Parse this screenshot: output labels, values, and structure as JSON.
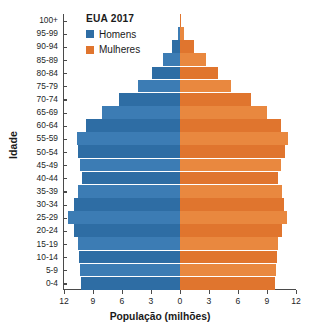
{
  "chart_data": {
    "type": "bar",
    "subtype": "population-pyramid",
    "title": "EUA 2017",
    "xlabel": "População (milhões)",
    "ylabel": "Idade",
    "grid": false,
    "legend_position": "top-left",
    "xlim": [
      -12,
      12
    ],
    "xticks": [
      "12",
      "9",
      "6",
      "3",
      "0",
      "3",
      "6",
      "9",
      "12"
    ],
    "xtick_values": [
      -12,
      -9,
      -6,
      -3,
      0,
      3,
      6,
      9,
      12
    ],
    "categories": [
      "0-4",
      "5-9",
      "10-14",
      "15-19",
      "20-24",
      "25-29",
      "30-34",
      "35-39",
      "40-44",
      "45-49",
      "50-54",
      "55-59",
      "60-64",
      "65-69",
      "70-74",
      "75-79",
      "80-84",
      "85-89",
      "90-94",
      "95-99",
      "100+"
    ],
    "series": [
      {
        "name": "Homens",
        "color": "#2E6DA4",
        "values": [
          10.2,
          10.3,
          10.4,
          10.6,
          11.0,
          11.6,
          11.0,
          10.6,
          10.1,
          10.3,
          10.6,
          10.7,
          9.7,
          8.1,
          6.3,
          4.3,
          2.9,
          1.8,
          0.8,
          0.2,
          0.04
        ]
      },
      {
        "name": "Mulheres",
        "color": "#E0752E",
        "values": [
          9.8,
          9.9,
          10.0,
          10.1,
          10.5,
          11.1,
          10.8,
          10.5,
          10.1,
          10.4,
          10.9,
          11.2,
          10.4,
          9.0,
          7.3,
          5.3,
          3.9,
          2.7,
          1.4,
          0.4,
          0.08
        ]
      }
    ]
  },
  "legend": {
    "items": [
      {
        "label": "Homens",
        "color": "#2E6DA4"
      },
      {
        "label": "Mulheres",
        "color": "#E0752E"
      }
    ]
  },
  "colors": {
    "male": "#2E6DA4",
    "male_alt": "#3C7CB4",
    "female": "#E0752E",
    "female_alt": "#E9883F",
    "axis": "#4a4a4a",
    "text": "#231f1f"
  }
}
